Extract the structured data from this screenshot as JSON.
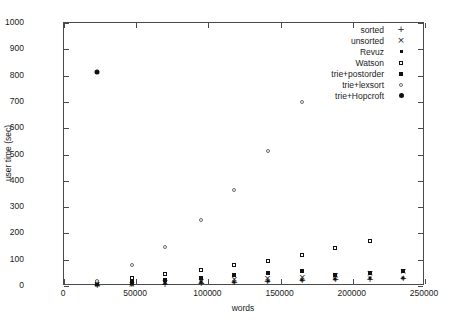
{
  "chart_data": {
    "type": "scatter",
    "title": "",
    "xlabel": "words",
    "ylabel": "user time (sec)",
    "xlim": [
      0,
      250000
    ],
    "ylim": [
      0,
      1000
    ],
    "xticks": [
      0,
      50000,
      100000,
      150000,
      200000,
      250000
    ],
    "xtick_labels": [
      "0",
      "50000",
      "100000",
      "150000",
      "200000",
      "250000"
    ],
    "yticks": [
      0,
      100,
      200,
      300,
      400,
      500,
      600,
      700,
      800,
      900,
      1000
    ],
    "ytick_labels": [
      "0",
      "100",
      "200",
      "300",
      "400",
      "500",
      "600",
      "700",
      "800",
      "900",
      "1000"
    ],
    "grid": false,
    "legend_position": "top-right",
    "series": [
      {
        "name": "sorted",
        "marker": "plus",
        "points": [
          {
            "x": 23000,
            "y": 4
          },
          {
            "x": 47000,
            "y": 6
          },
          {
            "x": 70000,
            "y": 9
          },
          {
            "x": 95000,
            "y": 12
          },
          {
            "x": 118000,
            "y": 15
          },
          {
            "x": 141000,
            "y": 18
          },
          {
            "x": 165000,
            "y": 21
          },
          {
            "x": 188000,
            "y": 25
          },
          {
            "x": 212000,
            "y": 28
          },
          {
            "x": 235000,
            "y": 32
          }
        ]
      },
      {
        "name": "unsorted",
        "marker": "cross",
        "points": [
          {
            "x": 23000,
            "y": 6
          },
          {
            "x": 47000,
            "y": 9
          },
          {
            "x": 70000,
            "y": 14
          },
          {
            "x": 95000,
            "y": 19
          },
          {
            "x": 118000,
            "y": 25
          },
          {
            "x": 141000,
            "y": 30
          },
          {
            "x": 165000,
            "y": 36
          },
          {
            "x": 188000,
            "y": 43
          },
          {
            "x": 212000,
            "y": 50
          },
          {
            "x": 235000,
            "y": 58
          }
        ]
      },
      {
        "name": "Revuz",
        "marker": "filled-square-small",
        "points": [
          {
            "x": 23000,
            "y": 5
          },
          {
            "x": 47000,
            "y": 8
          },
          {
            "x": 70000,
            "y": 11
          },
          {
            "x": 95000,
            "y": 14
          },
          {
            "x": 118000,
            "y": 17
          },
          {
            "x": 141000,
            "y": 20
          },
          {
            "x": 165000,
            "y": 23
          },
          {
            "x": 188000,
            "y": 26
          },
          {
            "x": 212000,
            "y": 29
          },
          {
            "x": 235000,
            "y": 32
          }
        ]
      },
      {
        "name": "Watson",
        "marker": "open-square",
        "points": [
          {
            "x": 23000,
            "y": 16
          },
          {
            "x": 47000,
            "y": 30
          },
          {
            "x": 70000,
            "y": 45
          },
          {
            "x": 95000,
            "y": 60
          },
          {
            "x": 118000,
            "y": 78
          },
          {
            "x": 141000,
            "y": 96
          },
          {
            "x": 165000,
            "y": 118
          },
          {
            "x": 188000,
            "y": 145
          },
          {
            "x": 212000,
            "y": 172
          }
        ]
      },
      {
        "name": "trie+postorder",
        "marker": "filled-square",
        "points": [
          {
            "x": 23000,
            "y": 8
          },
          {
            "x": 47000,
            "y": 15
          },
          {
            "x": 70000,
            "y": 23
          },
          {
            "x": 95000,
            "y": 31
          },
          {
            "x": 118000,
            "y": 40
          },
          {
            "x": 141000,
            "y": 49
          },
          {
            "x": 165000,
            "y": 57
          },
          {
            "x": 188000,
            "y": 43
          },
          {
            "x": 212000,
            "y": 50
          },
          {
            "x": 235000,
            "y": 58
          }
        ]
      },
      {
        "name": "trie+lexsort",
        "marker": "open-circle",
        "points": [
          {
            "x": 23000,
            "y": 18
          },
          {
            "x": 47000,
            "y": 78
          },
          {
            "x": 70000,
            "y": 148
          },
          {
            "x": 95000,
            "y": 252
          },
          {
            "x": 118000,
            "y": 365
          },
          {
            "x": 141000,
            "y": 512
          },
          {
            "x": 165000,
            "y": 700
          }
        ]
      },
      {
        "name": "trie+Hopcroft",
        "marker": "filled-circle",
        "points": [
          {
            "x": 23000,
            "y": 812
          }
        ]
      }
    ]
  },
  "legend": {
    "entries": [
      {
        "label": "sorted",
        "marker": "plus"
      },
      {
        "label": "unsorted",
        "marker": "cross"
      },
      {
        "label": "Revuz",
        "marker": "filled-square-small"
      },
      {
        "label": "Watson",
        "marker": "open-square"
      },
      {
        "label": "trie+postorder",
        "marker": "filled-square"
      },
      {
        "label": "trie+lexsort",
        "marker": "open-circle"
      },
      {
        "label": "trie+Hopcroft",
        "marker": "filled-circle"
      }
    ]
  },
  "colors": {
    "axis": "#4a4a4a",
    "marker": "#111111",
    "background": "#ffffff",
    "text": "#1a1a1a"
  }
}
